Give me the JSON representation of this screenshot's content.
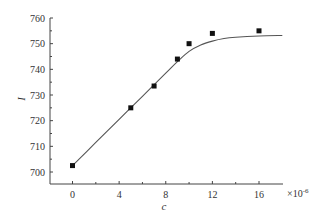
{
  "chart_data": {
    "type": "scatter",
    "title": "",
    "xlabel": "c",
    "ylabel": "I",
    "x_multiplier": "×10",
    "x_multiplier_exp": "-6",
    "xlim": [
      -1.8,
      18
    ],
    "ylim": [
      695,
      760
    ],
    "xticks": [
      0,
      4,
      8,
      12,
      16
    ],
    "xticks_minor": [
      2,
      6,
      10,
      14
    ],
    "yticks": [
      700,
      710,
      720,
      730,
      740,
      750,
      760
    ],
    "grid": false,
    "legend": null,
    "series": [
      {
        "name": "measured",
        "kind": "scatter",
        "marker": "square",
        "color": "#111111",
        "x": [
          0,
          5,
          7,
          9,
          10,
          12,
          16
        ],
        "y": [
          702.5,
          725,
          733.5,
          744,
          750,
          754,
          755
        ]
      },
      {
        "name": "fit",
        "kind": "line",
        "color": "#555555",
        "x": [
          0,
          2,
          4,
          6,
          8,
          9,
          10,
          11,
          12,
          13,
          14,
          16,
          18
        ],
        "y": [
          702.5,
          711.5,
          720.5,
          729.5,
          738.5,
          743,
          747,
          749.5,
          751,
          752,
          752.5,
          753,
          753.2
        ]
      }
    ]
  }
}
